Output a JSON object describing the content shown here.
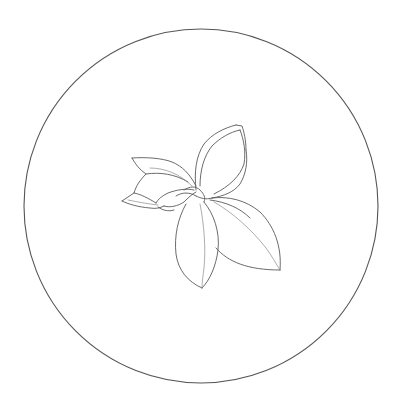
{
  "illustration": {
    "subject": "flower-line-drawing",
    "background_color": "#ffffff",
    "line_color": "#5a5a5a",
    "frame": {
      "shape": "circle",
      "cx": 201,
      "cy": 206,
      "r": 177,
      "color": "#555555"
    },
    "petals": [
      {
        "name": "upper-left-petal",
        "tip": [
          132,
          158
        ]
      },
      {
        "name": "left-bud-petal",
        "tip": [
          122,
          201
        ]
      },
      {
        "name": "top-petal",
        "tip": [
          236,
          125
        ]
      },
      {
        "name": "bottom-petal",
        "tip": [
          202,
          288
        ]
      },
      {
        "name": "right-petal",
        "tip": [
          280,
          270
        ]
      }
    ]
  }
}
